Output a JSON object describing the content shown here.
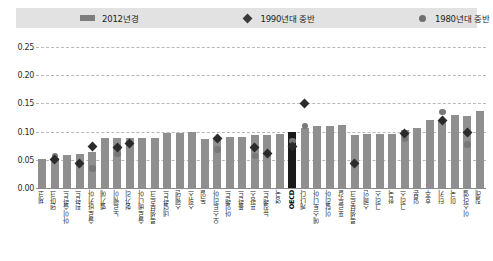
{
  "legend": {
    "entries": [
      {
        "label": "2012년경",
        "marker": "bar-swatch",
        "color": "#7d7d7d"
      },
      {
        "label": "1990년대 중반",
        "marker": "diamond-marker",
        "color": "#3a3a3a"
      },
      {
        "label": "1980년대 중반",
        "marker": "circle-marker",
        "color": "#6f6f6f"
      }
    ]
  },
  "axis": {
    "y_ticks": [
      "0.25",
      "0.20",
      "0.15",
      "0.10",
      "0.05",
      "0.00"
    ],
    "y_values": [
      0.25,
      0.2,
      0.15,
      0.1,
      0.05,
      0.0
    ]
  },
  "chart_data": {
    "type": "bar",
    "title": "",
    "subtitle": "",
    "xlabel": "",
    "ylabel": "",
    "ylim": [
      0,
      0.25
    ],
    "grid": true,
    "legend_position": "top",
    "highlight_category": "OECD",
    "categories": [
      "체코",
      "덴마크",
      "아이슬란드",
      "핀란드",
      "슬로바키아",
      "벨기에",
      "노르웨이",
      "헝가리",
      "슬로베니아",
      "룩셈부르크",
      "네덜란드",
      "스웨덴",
      "스위스",
      "독일",
      "오스트리아",
      "아일랜드",
      "폴란드",
      "프랑스",
      "뉴질랜드",
      "영국",
      "OECD",
      "캐나다",
      "에스토니아",
      "이탈리아",
      "포르투갈",
      "룩셈부르크",
      "스페인",
      "그리스",
      "한국",
      "그리스",
      "일본",
      "호주",
      "터키",
      "미국",
      "이스라엘",
      "칠레"
    ],
    "series": [
      {
        "name": "2012년경",
        "type": "bar",
        "color": "#8f8f8f",
        "values": [
          0.052,
          0.053,
          0.058,
          0.061,
          0.064,
          0.088,
          0.088,
          0.088,
          0.088,
          0.088,
          0.097,
          0.098,
          0.099,
          0.087,
          0.089,
          0.09,
          0.09,
          0.094,
          0.094,
          0.096,
          0.099,
          0.106,
          0.11,
          0.11,
          0.112,
          0.094,
          0.095,
          0.096,
          0.096,
          0.102,
          0.106,
          0.121,
          0.121,
          0.13,
          0.128,
          0.136
        ]
      },
      {
        "name": "1990년대 중반",
        "type": "diamond",
        "color": "#2b2b2b",
        "values": [
          null,
          0.05,
          null,
          0.043,
          0.074,
          null,
          0.072,
          0.079,
          null,
          null,
          null,
          null,
          null,
          null,
          0.088,
          null,
          null,
          0.072,
          0.061,
          null,
          0.074,
          0.15,
          null,
          null,
          null,
          0.044,
          null,
          null,
          null,
          0.096,
          null,
          null,
          0.12,
          null,
          0.099,
          null
        ]
      },
      {
        "name": "1980년대 중반",
        "type": "circle",
        "color": "#787878",
        "values": [
          null,
          0.056,
          null,
          null,
          0.035,
          null,
          0.06,
          null,
          null,
          null,
          null,
          null,
          null,
          null,
          0.068,
          null,
          null,
          0.057,
          null,
          null,
          0.083,
          0.11,
          null,
          null,
          null,
          null,
          null,
          null,
          null,
          0.088,
          null,
          null,
          0.135,
          null,
          0.077,
          null
        ]
      }
    ]
  }
}
